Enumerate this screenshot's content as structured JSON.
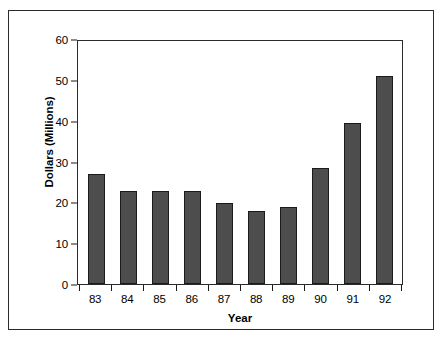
{
  "chart_data": {
    "type": "bar",
    "title": "",
    "xlabel": "Year",
    "ylabel": "Dollars (Millions)",
    "categories": [
      "83",
      "84",
      "85",
      "86",
      "87",
      "88",
      "89",
      "90",
      "91",
      "92"
    ],
    "values": [
      27,
      22.7,
      22.7,
      22.7,
      19.8,
      17.8,
      18.8,
      28.4,
      39.5,
      51
    ],
    "ylim": [
      0,
      60
    ],
    "yticks": [
      0,
      10,
      20,
      30,
      40,
      50,
      60
    ],
    "ytick_labels": [
      "0",
      "10",
      "20",
      "30",
      "40",
      "50",
      "60"
    ],
    "grid": false,
    "legend": false,
    "series": [
      {
        "name": "Dollars (Millions)",
        "values": [
          27,
          22.7,
          22.7,
          22.7,
          19.8,
          17.8,
          18.8,
          28.4,
          39.5,
          51
        ]
      }
    ],
    "colors": {
      "bar_fill": "#4d4d4d",
      "bar_stroke": "#1b1b1b",
      "axis": "#2b2b2b",
      "text": "#000000",
      "background": "#ffffff"
    }
  }
}
